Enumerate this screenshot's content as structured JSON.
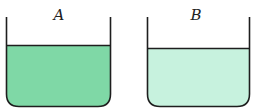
{
  "beakers": [
    {
      "label": "A",
      "liquid_color": "#7fd8a6",
      "description": "darker green solution"
    },
    {
      "label": "B",
      "liquid_color": "#c7f2de",
      "description": "lighter green solution"
    }
  ]
}
